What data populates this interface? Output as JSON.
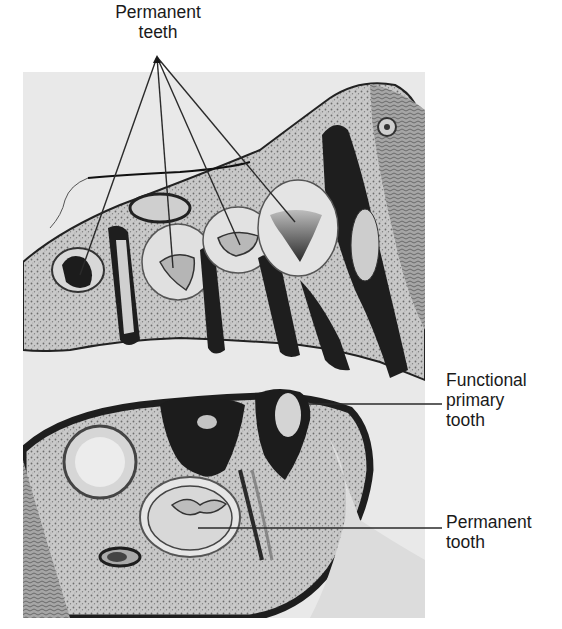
{
  "figure": {
    "type": "labeled histology micrograph",
    "labels": {
      "permanent_teeth": {
        "line1": "Permanent",
        "line2": "teeth",
        "pointer_count": 4
      },
      "functional_primary_tooth": {
        "line1": "Functional",
        "line2": "primary",
        "line3": "tooth"
      },
      "permanent_tooth": {
        "line1": "Permanent",
        "line2": "tooth"
      }
    },
    "colors": {
      "background": "#ffffff",
      "micrograph_bg": "#e9e9e9",
      "tissue_dark": "#1e1e1e",
      "tissue_mid": "#8a8a8a",
      "tissue_light": "#cfcfcf",
      "leader_line": "#2a2a2a",
      "text": "#1a1a1a"
    }
  }
}
